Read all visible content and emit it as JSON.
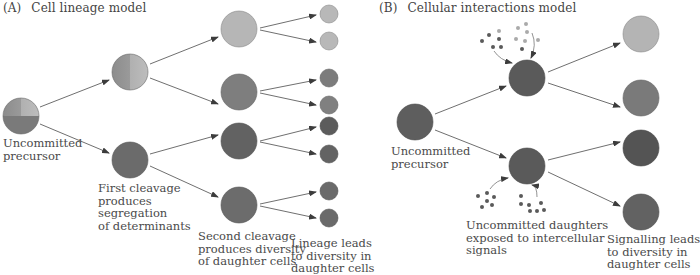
{
  "panel_a": {
    "letter": "(A)",
    "title": "Cell lineage model",
    "labels": {
      "precursor": "Uncommitted\nprecursor",
      "first_cleavage": "First cleavage\nproduces\nsegregation\nof determinants",
      "second_cleavage": "Second cleavage\nproduces diversity\nof daughter cells",
      "lineage_result": "Lineage leads\nto diversity in\ndaughter cells"
    }
  },
  "panel_b": {
    "letter": "(B)",
    "title": "Cellular  interactions model",
    "labels": {
      "precursor": "Uncommitted\nprecursor",
      "daughters": "Uncommitted daughters\nexposed to intercellular\nsignals",
      "signalling_result": "Signalling leads\nto diversity in\ndaughter cells"
    }
  },
  "colors": {
    "light": "#b4b4b4",
    "medium": "#808080",
    "medium_dark": "#6e6e6e",
    "dark": "#555555",
    "arrow": "#4a4a4a",
    "signal_dark": "#5a5a5a",
    "signal_light": "#aaaaaa"
  }
}
